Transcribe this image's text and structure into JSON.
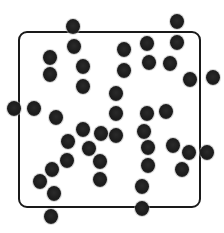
{
  "diagram": {
    "type": "particles-in-container",
    "box": {
      "left": 18,
      "top": 31,
      "right": 199,
      "bottom": 206,
      "corner_radius": 9,
      "stroke": "#1a1a1a",
      "stroke_width": 2
    },
    "particle_style": {
      "fill": "#1b1b1b",
      "diameter": 14
    },
    "particles": [
      {
        "x": 73,
        "y": 26
      },
      {
        "x": 74,
        "y": 46
      },
      {
        "x": 50,
        "y": 57
      },
      {
        "x": 50,
        "y": 74
      },
      {
        "x": 83,
        "y": 66
      },
      {
        "x": 83,
        "y": 86
      },
      {
        "x": 124,
        "y": 49
      },
      {
        "x": 124,
        "y": 70
      },
      {
        "x": 147,
        "y": 43
      },
      {
        "x": 149,
        "y": 62
      },
      {
        "x": 177,
        "y": 21
      },
      {
        "x": 177,
        "y": 42
      },
      {
        "x": 170,
        "y": 63
      },
      {
        "x": 190,
        "y": 79
      },
      {
        "x": 213,
        "y": 77
      },
      {
        "x": 14,
        "y": 108
      },
      {
        "x": 34,
        "y": 108
      },
      {
        "x": 56,
        "y": 117
      },
      {
        "x": 116,
        "y": 93
      },
      {
        "x": 116,
        "y": 113
      },
      {
        "x": 147,
        "y": 113
      },
      {
        "x": 166,
        "y": 111
      },
      {
        "x": 83,
        "y": 129
      },
      {
        "x": 101,
        "y": 133
      },
      {
        "x": 116,
        "y": 135
      },
      {
        "x": 68,
        "y": 141
      },
      {
        "x": 89,
        "y": 148
      },
      {
        "x": 67,
        "y": 160
      },
      {
        "x": 100,
        "y": 161
      },
      {
        "x": 144,
        "y": 131
      },
      {
        "x": 148,
        "y": 147
      },
      {
        "x": 148,
        "y": 165
      },
      {
        "x": 173,
        "y": 145
      },
      {
        "x": 189,
        "y": 152
      },
      {
        "x": 207,
        "y": 152
      },
      {
        "x": 182,
        "y": 169
      },
      {
        "x": 100,
        "y": 179
      },
      {
        "x": 52,
        "y": 169
      },
      {
        "x": 40,
        "y": 181
      },
      {
        "x": 54,
        "y": 193
      },
      {
        "x": 142,
        "y": 186
      },
      {
        "x": 142,
        "y": 208
      },
      {
        "x": 51,
        "y": 216
      }
    ]
  }
}
